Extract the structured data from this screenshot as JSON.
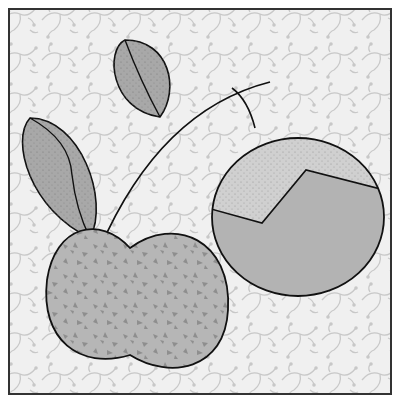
{
  "illustration": {
    "description": "Stylized apple with stem and two leaves, plus a cut apple slice circle, on a vine-pattern background",
    "colors": {
      "background": "#f0f0f0",
      "pattern": "#c8c8c8",
      "apple": "#b4b4b4",
      "apple_speckle": "#8e8e8e",
      "leaf": "#aaaaaa",
      "slice_top": "#cfcfcf",
      "slice_bottom": "#b2b2b2",
      "outline": "#222222",
      "frame": "#333333"
    }
  }
}
